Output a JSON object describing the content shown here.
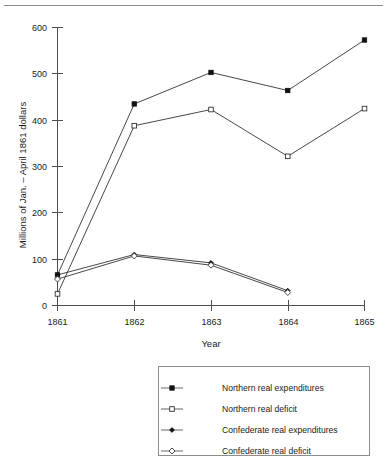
{
  "chart_data": {
    "type": "line",
    "title": "",
    "xlabel": "Year",
    "ylabel": "Millions of Jan. – April 1861 dollars",
    "x": [
      1861,
      1862,
      1863,
      1864,
      1865
    ],
    "xticklabels": [
      "1861",
      "1862",
      "1863",
      "1864",
      "1865"
    ],
    "yticks": [
      0,
      100,
      200,
      300,
      400,
      500,
      600
    ],
    "yticklabels": [
      "0",
      "100",
      "200",
      "300",
      "400",
      "500",
      "600"
    ],
    "ylim": [
      0,
      620
    ],
    "xlim": [
      1860.85,
      1865.15
    ],
    "grid": false,
    "legend_position": "below-plot-right",
    "series": [
      {
        "name": "Northern real expenditures",
        "marker": "filled-square",
        "x": [
          1861,
          1862,
          1863,
          1864,
          1865
        ],
        "values": [
          66,
          435,
          503,
          464,
          573
        ]
      },
      {
        "name": "Northern real deficit",
        "marker": "open-square",
        "x": [
          1861,
          1862,
          1863,
          1864,
          1865
        ],
        "values": [
          25,
          388,
          423,
          322,
          425
        ]
      },
      {
        "name": "Confederate real expenditures",
        "marker": "filled-diamond",
        "x": [
          1861,
          1862,
          1863,
          1864
        ],
        "values": [
          66,
          110,
          92,
          32
        ]
      },
      {
        "name": "Confederate real deficit",
        "marker": "open-diamond",
        "x": [
          1861,
          1862,
          1863,
          1864
        ],
        "values": [
          57,
          107,
          87,
          28
        ]
      }
    ]
  },
  "legend": {
    "items": [
      {
        "label": "Northern real expenditures",
        "marker": "filled-square"
      },
      {
        "label": "Northern real deficit",
        "marker": "open-square"
      },
      {
        "label": "Confederate real expenditures",
        "marker": "filled-diamond"
      },
      {
        "label": "Confederate real deficit",
        "marker": "open-diamond"
      }
    ]
  },
  "axes": {
    "x_title": "Year",
    "y_title": "Millions of Jan. – April 1861 dollars",
    "x_ticks": [
      "1861",
      "1862",
      "1863",
      "1864",
      "1865"
    ],
    "y_ticks": [
      "600",
      "500",
      "400",
      "300",
      "200",
      "100",
      "0"
    ]
  },
  "colors": {
    "axis": "#4d4d4d",
    "line": "#333333",
    "marker_fill": "#111111",
    "marker_open_fill": "#ffffff",
    "legend_border": "#8c8c8c",
    "text": "#1a1a1a",
    "background": "#ffffff"
  }
}
